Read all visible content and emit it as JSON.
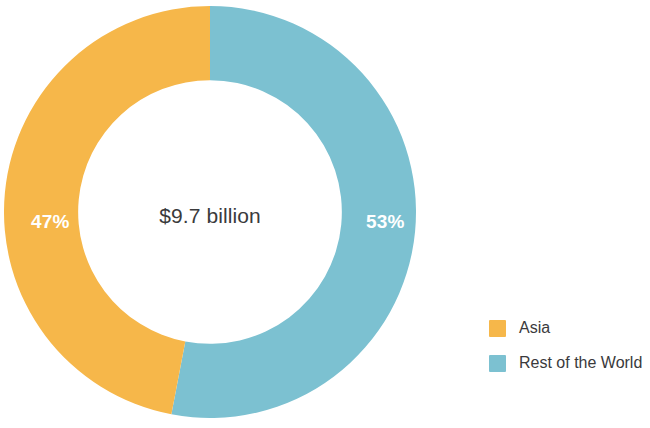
{
  "chart_data": {
    "type": "pie",
    "variant": "donut",
    "title": "",
    "subtitle": "",
    "center_label": "$9.7 billion",
    "categories": [
      "Asia",
      "Rest of the World"
    ],
    "values": [
      47,
      53
    ],
    "value_unit": "%",
    "data_labels": [
      "47%",
      "53%"
    ],
    "colors": [
      "#f6b74a",
      "#7cc1d1"
    ],
    "legend": {
      "position": "right",
      "entries": [
        {
          "label": "Asia",
          "color": "#f6b74a",
          "value": 47,
          "data_label": "47%"
        },
        {
          "label": "Rest of the World",
          "color": "#7cc1d1",
          "value": 53,
          "data_label": "53%"
        }
      ]
    },
    "start_angle_deg": 0,
    "direction": "clockwise",
    "hole_ratio": 0.64,
    "grid": false,
    "xlabel": "",
    "ylabel": ""
  },
  "chart": {
    "center_total": "$9.7 billion",
    "slices": {
      "asia": {
        "label": "47%",
        "color": "#f6b74a"
      },
      "rest_of_world": {
        "label": "53%",
        "color": "#7cc1d1"
      }
    }
  },
  "legend": {
    "items": [
      {
        "label": "Asia",
        "color": "#f6b74a"
      },
      {
        "label": "Rest of the World",
        "color": "#7cc1d1"
      }
    ]
  },
  "theme": {
    "background": "#ffffff",
    "text": "#3a3a3c",
    "label_text": "#ffffff",
    "accent_orange": "#f6b74a",
    "accent_blue": "#7cc1d1"
  }
}
